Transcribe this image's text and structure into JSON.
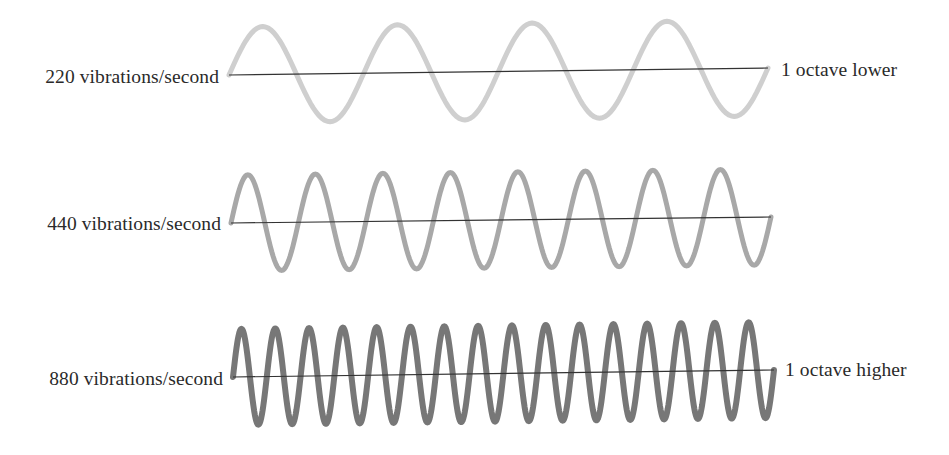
{
  "diagram": {
    "type": "sine-wave-comparison",
    "axis_color": "#333333",
    "rows": [
      {
        "frequency_label": "220 vibrations/second",
        "octave_label": "1 octave lower",
        "cycles": 4,
        "stroke_color": "#cfcfcf",
        "stroke_width": 5,
        "x_start": 229,
        "x_end": 768,
        "axis_y_start": 75,
        "axis_y_end": 68,
        "amplitude": 48,
        "label_left": {
          "right": 219,
          "baseline": 82
        },
        "label_right": {
          "left": 781,
          "baseline": 75
        }
      },
      {
        "frequency_label": "440 vibrations/second",
        "octave_label": "",
        "cycles": 8,
        "stroke_color": "#a8a8a8",
        "stroke_width": 5,
        "x_start": 231,
        "x_end": 771,
        "axis_y_start": 223,
        "axis_y_end": 217,
        "amplitude": 48,
        "label_left": {
          "right": 221,
          "baseline": 229
        },
        "label_right": null
      },
      {
        "frequency_label": "880 vibrations/second",
        "octave_label": "1 octave higher",
        "cycles": 16,
        "stroke_color": "#777777",
        "stroke_width": 6,
        "x_start": 233,
        "x_end": 774,
        "axis_y_start": 377,
        "axis_y_end": 370,
        "amplitude": 48,
        "label_left": {
          "right": 223,
          "baseline": 384
        },
        "label_right": {
          "left": 785,
          "baseline": 375
        }
      }
    ]
  }
}
